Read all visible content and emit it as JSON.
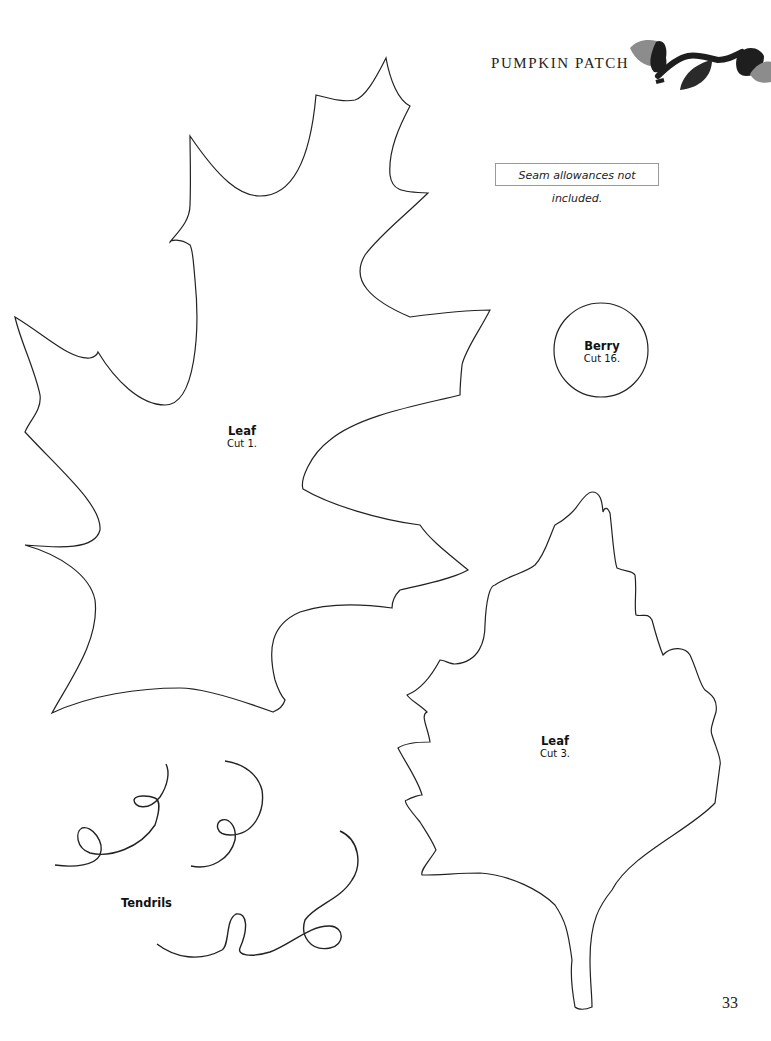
{
  "header": {
    "title": "PUMPKIN PATCH",
    "ornament": "acorn-and-leaf-vine-icon"
  },
  "note": {
    "text": "Seam allowances not included."
  },
  "patterns": [
    {
      "id": "leaf-large",
      "name": "Leaf",
      "cut": "Cut 1."
    },
    {
      "id": "berry",
      "name": "Berry",
      "cut": "Cut 16."
    },
    {
      "id": "leaf-small",
      "name": "Leaf",
      "cut": "Cut 3."
    },
    {
      "id": "tendrils",
      "name": "Tendrils"
    }
  ],
  "colors": {
    "outline": "#222222",
    "ornament_dark": "#1e1e1e",
    "ornament_light": "#8c8c8c"
  },
  "page": {
    "number": "33"
  }
}
